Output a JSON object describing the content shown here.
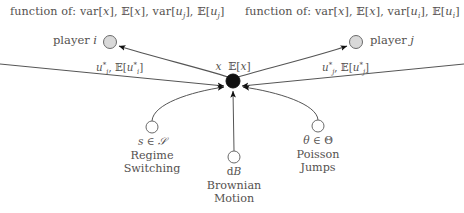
{
  "figure": {
    "type": "node-link-diagram"
  },
  "annotations": {
    "left_function_of": "function of: var[x], ᴇ[x], var[uⱼ], ᴇ[uⱼ]",
    "right_function_of": "function of: var[x], ᴇ[x], var[uᵢ], ᴇ[uᵢ]",
    "left_function_prefix": "function of:",
    "right_function_prefix": "function of:"
  },
  "nodes": {
    "player_i": {
      "label": "player i",
      "name_text": "player",
      "index_text": "i",
      "x": 110,
      "y": 42,
      "r": 6.5,
      "fill": "#d9d9d9",
      "stroke": "#6a6a6a"
    },
    "player_j": {
      "label": "player j",
      "name_text": "player",
      "index_text": "j",
      "x": 356,
      "y": 42,
      "r": 6.5,
      "fill": "#d9d9d9",
      "stroke": "#6a6a6a"
    },
    "hub": {
      "label": "x  ᴇ[x]",
      "x": 233,
      "y": 81,
      "r": 7,
      "fill": "#111111",
      "stroke": "#111111"
    },
    "regime": {
      "symbol": "s ∈ 𝒮",
      "name_line1": "Regime",
      "name_line2": "Switching",
      "x": 152,
      "y": 127,
      "r": 6,
      "fill": "#ffffff",
      "stroke": "#6a6a6a"
    },
    "brownian": {
      "symbol": "dB",
      "name_line1": "Brownian",
      "name_line2": "Motion",
      "x": 234,
      "y": 157,
      "r": 6,
      "fill": "#ffffff",
      "stroke": "#6a6a6a"
    },
    "poisson": {
      "symbol": "θ ∈ Θ",
      "name_line1": "Poisson",
      "name_line2": "Jumps",
      "x": 318,
      "y": 126,
      "r": 6,
      "fill": "#ffffff",
      "stroke": "#6a6a6a"
    }
  },
  "edges": {
    "hub_to_player_i": {
      "label": "u*ᵢ, ᴇ[u*ᵢ]",
      "from": "hub",
      "to": "player_i",
      "direction": "to-player-i"
    },
    "hub_to_player_j": {
      "label": "u*ⱼ, ᴇ[u*ⱼ]",
      "from": "hub",
      "to": "player_j",
      "direction": "to-player-j"
    },
    "player_i_to_hub": {
      "from": "player_i",
      "to": "hub",
      "label": ""
    },
    "player_j_to_hub": {
      "from": "player_j",
      "to": "hub",
      "label": ""
    },
    "regime_to_hub": {
      "from": "regime",
      "to": "hub",
      "label": ""
    },
    "brownian_to_hub": {
      "from": "brownian",
      "to": "hub",
      "label": ""
    },
    "poisson_to_hub": {
      "from": "poisson",
      "to": "hub",
      "label": ""
    }
  },
  "colors": {
    "text": "#555250",
    "line": "#555555",
    "hub_fill": "#111111",
    "player_fill": "#d9d9d9",
    "source_fill": "#ffffff",
    "background": "#ffffff"
  }
}
